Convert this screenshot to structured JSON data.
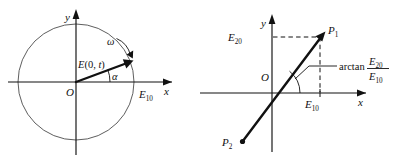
{
  "figure": {
    "kind": "two-panel-vector-diagram",
    "background_color": "#ffffff",
    "ink_color": "#111111",
    "circle_color": "#555555"
  },
  "left_panel": {
    "name": "rotating-phasor-on-circle",
    "axis_x_label": "x",
    "axis_y_label": "y",
    "origin_label": "O",
    "vector_label": "E(0, t)",
    "vector_label_parts": {
      "symbol": "E",
      "arg_open": "(0, ",
      "arg_var": "t",
      "arg_close": ")"
    },
    "angle_label": "α",
    "omega_label": "ω",
    "endpoint_label_base": "E",
    "endpoint_label_sub": "10",
    "circle": {
      "center_x": 76,
      "center_y": 82,
      "radius": 58
    },
    "vector_angle_degrees": 20
  },
  "right_panel": {
    "name": "phasor-endpoints-line",
    "axis_x_label": "x",
    "axis_y_label": "y",
    "origin_label": "O",
    "point_1_base": "P",
    "point_1_sub": "1",
    "point_2_base": "P",
    "point_2_sub": "2",
    "y_intercept_base": "E",
    "y_intercept_sub": "20",
    "x_intercept_base": "E",
    "x_intercept_sub": "10",
    "angle_expression": {
      "function": "arctan",
      "numerator_base": "E",
      "numerator_sub": "20",
      "denominator_base": "E",
      "denominator_sub": "10"
    }
  }
}
